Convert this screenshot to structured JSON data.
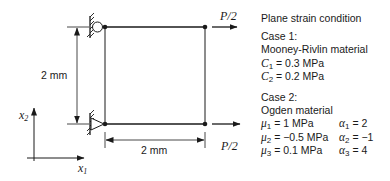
{
  "diagram": {
    "vertical_dimension": "2 mm",
    "horizontal_dimension": "2 mm",
    "load_top": "P/2",
    "load_bottom": "P/2",
    "axis_x1": {
      "var": "x",
      "sub": "1"
    },
    "axis_x2": {
      "var": "x",
      "sub": "2"
    },
    "supports": {
      "top_left": "roller",
      "bottom_left": "pin"
    }
  },
  "panel": {
    "condition": "Plane strain condition",
    "case1": {
      "title": "Case 1:",
      "material": "Mooney-Rivlin material",
      "params": [
        {
          "sym": "C",
          "sub": "1",
          "value": " = 0.3 MPa"
        },
        {
          "sym": "C",
          "sub": "2",
          "value": " = 0.2 MPa"
        }
      ]
    },
    "case2": {
      "title": "Case 2:",
      "material": "Ogden material",
      "params": [
        {
          "mu_sym": "μ",
          "mu_sub": "1",
          "mu_value": " = 1 MPa",
          "alpha_sym": "α",
          "alpha_sub": "1",
          "alpha_value": " = 2"
        },
        {
          "mu_sym": "μ",
          "mu_sub": "2",
          "mu_value": " = −0.5 MPa",
          "alpha_sym": "α",
          "alpha_sub": "2",
          "alpha_value": " = −1"
        },
        {
          "mu_sym": "μ",
          "mu_sub": "3",
          "mu_value": " = 0.1 MPa",
          "alpha_sym": "α",
          "alpha_sub": "3",
          "alpha_value": " = 4"
        }
      ]
    }
  }
}
